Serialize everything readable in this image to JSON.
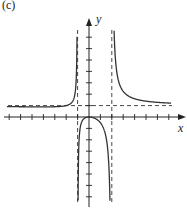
{
  "figure": {
    "part_label": "(c)",
    "x_axis_label": "x",
    "y_axis_label": "y"
  },
  "chart_data": {
    "type": "line",
    "title": "",
    "xlabel": "x",
    "ylabel": "y",
    "xlim": [
      -8,
      8
    ],
    "ylim": [
      -7,
      7
    ],
    "grid": false,
    "ticks": {
      "x": [
        -8,
        -7,
        -6,
        -5,
        -4,
        -3,
        -2,
        -1,
        1,
        2,
        3,
        4,
        5,
        6,
        7
      ],
      "y": [
        -7,
        -6,
        -5,
        -4,
        -3,
        -2,
        -1,
        1,
        2,
        3,
        4,
        5,
        6,
        7
      ]
    },
    "asymptotes": {
      "vertical": [
        -1,
        2
      ],
      "horizontal": [
        1
      ]
    },
    "function": "x^2/((x+1)(x-2))",
    "key_points": [
      {
        "x": 0,
        "y": 0,
        "note": "local maximum touching origin"
      }
    ],
    "colors": {
      "curve": "#333333",
      "axes": "#222222",
      "asymptote": "#333333"
    }
  }
}
